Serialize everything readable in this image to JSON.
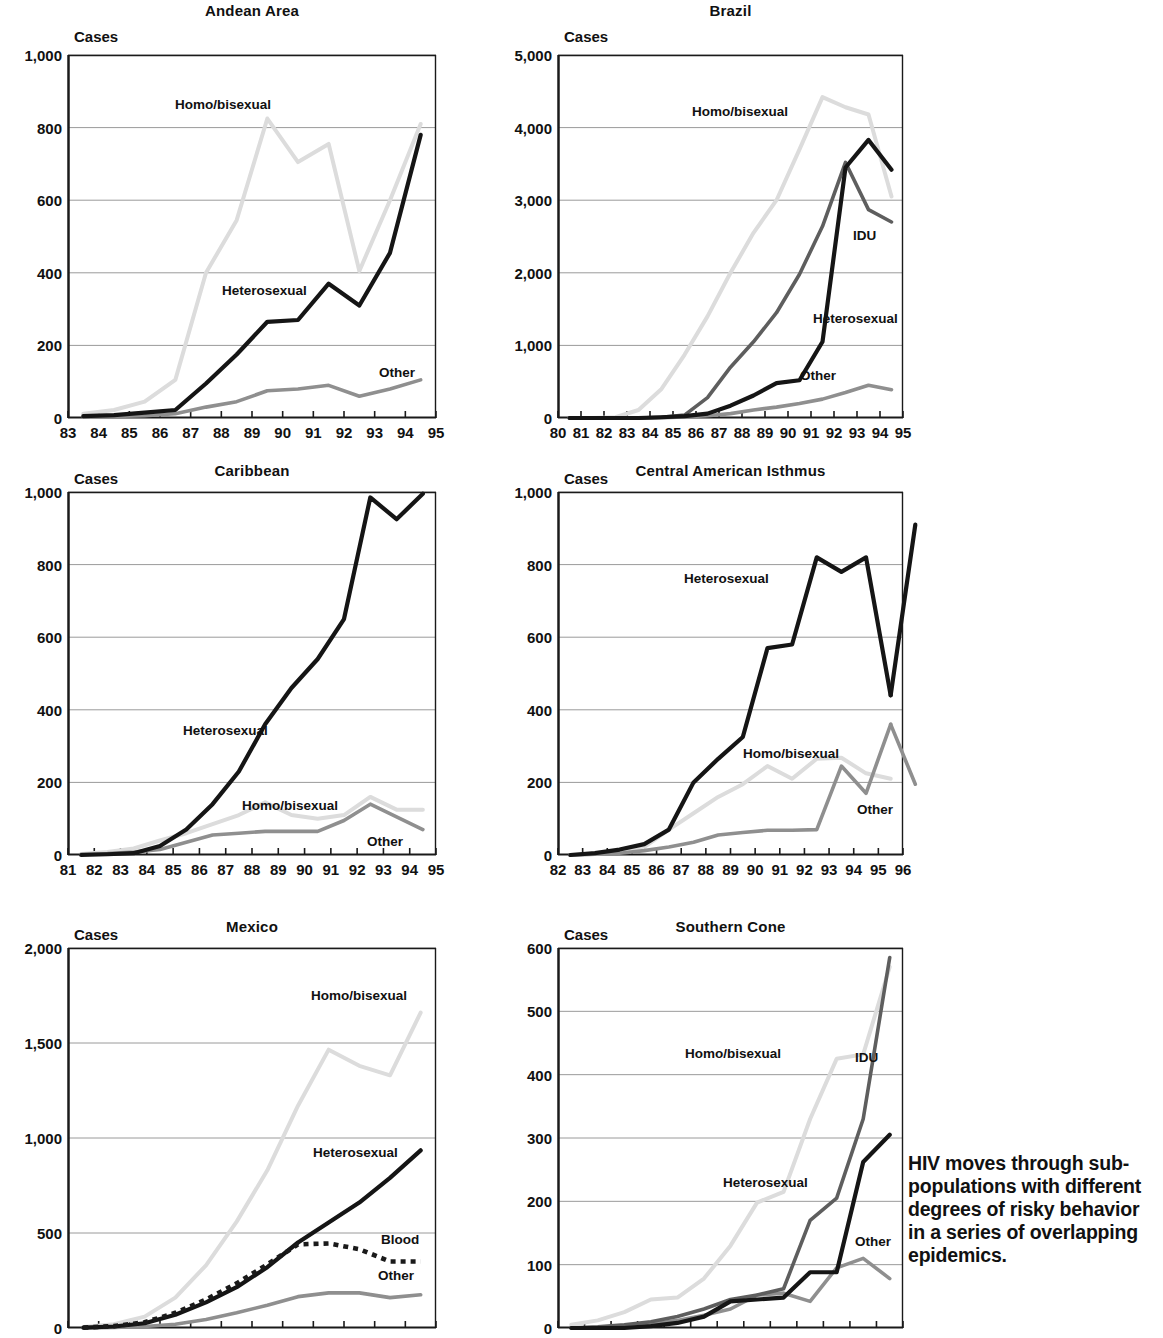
{
  "caption": {
    "lines": [
      "HIV moves through sub-",
      "populations with different",
      "degrees of risky behavior",
      "in a series of overlapping",
      "epidemics."
    ]
  },
  "colors": {
    "heterosexual": "#151515",
    "homo_bisexual": "#dcdcdc",
    "idu": "#5e5e5e",
    "other": "#8f8f8f",
    "blood": "#1a1a1a",
    "axis": "#1a1a1a",
    "grid": "#9a9a9a",
    "background": "#ffffff"
  },
  "axis_caption": "Cases",
  "chart_data": [
    {
      "type": "line",
      "title": "Andean Area",
      "xlabel": "",
      "ylabel": "Cases",
      "ylim": [
        0,
        1000
      ],
      "yticks": [
        0,
        200,
        400,
        600,
        800,
        1000
      ],
      "yticklabels": [
        "0",
        "200",
        "400",
        "600",
        "800",
        "1,000"
      ],
      "x": [
        83,
        84,
        85,
        86,
        87,
        88,
        89,
        90,
        91,
        92,
        93,
        94
      ],
      "xticklabels": [
        "83",
        "84",
        "85",
        "86",
        "87",
        "88",
        "89",
        "90",
        "91",
        "92",
        "93",
        "94",
        "95"
      ],
      "grid": true,
      "series": [
        {
          "name": "Homo/bisexual",
          "color_key": "homo_bisexual",
          "style": "solid",
          "values": [
            12,
            22,
            45,
            105,
            400,
            545,
            825,
            705,
            755,
            405,
            600,
            810
          ]
        },
        {
          "name": "Heterosexual",
          "color_key": "heterosexual",
          "style": "solid",
          "values": [
            5,
            8,
            15,
            22,
            95,
            175,
            265,
            270,
            370,
            310,
            455,
            780
          ]
        },
        {
          "name": "Other",
          "color_key": "other",
          "style": "solid",
          "values": [
            2,
            4,
            6,
            12,
            30,
            45,
            75,
            80,
            90,
            60,
            80,
            105
          ]
        }
      ]
    },
    {
      "type": "line",
      "title": "Brazil",
      "xlabel": "",
      "ylabel": "Cases",
      "ylim": [
        0,
        5000
      ],
      "yticks": [
        0,
        1000,
        2000,
        3000,
        4000,
        5000
      ],
      "yticklabels": [
        "0",
        "1,000",
        "2,000",
        "3,000",
        "4,000",
        "5,000"
      ],
      "x": [
        80,
        81,
        82,
        83,
        84,
        85,
        86,
        87,
        88,
        89,
        90,
        91,
        92,
        93,
        94
      ],
      "xticklabels": [
        "80",
        "81",
        "82",
        "83",
        "84",
        "85",
        "86",
        "87",
        "88",
        "89",
        "90",
        "91",
        "92",
        "93",
        "94",
        "95"
      ],
      "grid": true,
      "series": [
        {
          "name": "Homo/bisexual",
          "color_key": "homo_bisexual",
          "style": "solid",
          "values": [
            0,
            0,
            10,
            110,
            400,
            870,
            1400,
            2000,
            2550,
            3000,
            3700,
            4420,
            4280,
            4180,
            3050
          ]
        },
        {
          "name": "IDU",
          "color_key": "idu",
          "style": "solid",
          "values": [
            0,
            0,
            0,
            0,
            10,
            40,
            280,
            700,
            1050,
            1450,
            1980,
            2640,
            3520,
            2870,
            2700
          ]
        },
        {
          "name": "Heterosexual",
          "color_key": "heterosexual",
          "style": "solid",
          "values": [
            0,
            0,
            0,
            0,
            10,
            25,
            60,
            170,
            310,
            480,
            520,
            1050,
            3450,
            3830,
            3420
          ]
        },
        {
          "name": "Other",
          "color_key": "other",
          "style": "solid",
          "values": [
            0,
            0,
            0,
            0,
            5,
            15,
            30,
            60,
            110,
            150,
            200,
            260,
            350,
            450,
            390
          ]
        }
      ]
    },
    {
      "type": "line",
      "title": "Caribbean",
      "xlabel": "",
      "ylabel": "Cases",
      "ylim": [
        0,
        1000
      ],
      "yticks": [
        0,
        200,
        400,
        600,
        800,
        1000
      ],
      "yticklabels": [
        "0",
        "200",
        "400",
        "600",
        "800",
        "1,000"
      ],
      "x": [
        81,
        82,
        83,
        84,
        85,
        86,
        87,
        88,
        89,
        90,
        91,
        92,
        93,
        94
      ],
      "xticklabels": [
        "81",
        "82",
        "83",
        "84",
        "85",
        "86",
        "87",
        "88",
        "89",
        "90",
        "91",
        "92",
        "93",
        "94",
        "95"
      ],
      "grid": true,
      "series": [
        {
          "name": "Heterosexual",
          "color_key": "heterosexual",
          "style": "solid",
          "values": [
            0,
            2,
            5,
            25,
            70,
            140,
            230,
            360,
            460,
            540,
            650,
            985,
            925,
            995
          ]
        },
        {
          "name": "Homo/bisexual",
          "color_key": "homo_bisexual",
          "style": "solid",
          "values": [
            3,
            8,
            18,
            40,
            60,
            85,
            110,
            145,
            110,
            100,
            110,
            160,
            125,
            125
          ]
        },
        {
          "name": "Other",
          "color_key": "other",
          "style": "solid",
          "values": [
            2,
            4,
            8,
            15,
            35,
            55,
            60,
            65,
            65,
            65,
            95,
            140,
            105,
            70
          ]
        }
      ]
    },
    {
      "type": "line",
      "title": "Central American Isthmus",
      "xlabel": "",
      "ylabel": "Cases",
      "ylim": [
        0,
        1000
      ],
      "yticks": [
        0,
        200,
        400,
        600,
        800,
        1000
      ],
      "yticklabels": [
        "0",
        "200",
        "400",
        "600",
        "800",
        "1,000"
      ],
      "x": [
        82,
        83,
        84,
        85,
        86,
        87,
        88,
        89,
        90,
        91,
        92,
        93,
        94,
        95
      ],
      "xticklabels": [
        "82",
        "83",
        "84",
        "85",
        "86",
        "87",
        "88",
        "89",
        "90",
        "91",
        "92",
        "93",
        "94",
        "95",
        "96"
      ],
      "grid": true,
      "series": [
        {
          "name": "Heterosexual",
          "color_key": "heterosexual",
          "style": "solid",
          "values": [
            0,
            5,
            15,
            30,
            70,
            200,
            265,
            325,
            570,
            580,
            820,
            780,
            820,
            440
          ]
        },
        {
          "name": "Homo/bisexual",
          "color_key": "homo_bisexual",
          "style": "solid",
          "values": [
            0,
            3,
            10,
            22,
            70,
            115,
            160,
            195,
            245,
            210,
            265,
            268,
            225,
            210
          ]
        },
        {
          "name": "Other",
          "color_key": "other",
          "style": "solid",
          "values": [
            0,
            2,
            5,
            12,
            22,
            35,
            55,
            62,
            68,
            68,
            70,
            245,
            170,
            360
          ]
        }
      ],
      "extra_points": {
        "heterosexual_final": 910,
        "other_final": 195
      }
    },
    {
      "type": "line",
      "title": "Mexico",
      "xlabel": "",
      "ylabel": "Cases",
      "ylim": [
        0,
        2000
      ],
      "yticks": [
        0,
        500,
        1000,
        1500,
        2000
      ],
      "yticklabels": [
        "0",
        "500",
        "1,000",
        "1,500",
        "2,000"
      ],
      "x": [
        83,
        84,
        85,
        86,
        87,
        88,
        89,
        90,
        91,
        92,
        93,
        94
      ],
      "xticklabels": [],
      "grid": true,
      "clipped_bottom": true,
      "series": [
        {
          "name": "Homo/bisexual",
          "color_key": "homo_bisexual",
          "style": "solid",
          "values": [
            5,
            20,
            60,
            160,
            330,
            560,
            830,
            1170,
            1465,
            1380,
            1330,
            1660
          ]
        },
        {
          "name": "Heterosexual",
          "color_key": "heterosexual",
          "style": "solid",
          "values": [
            2,
            8,
            25,
            70,
            135,
            215,
            320,
            450,
            555,
            660,
            790,
            935
          ]
        },
        {
          "name": "Blood",
          "color_key": "blood",
          "style": "dotted",
          "values": [
            2,
            10,
            30,
            80,
            150,
            235,
            335,
            440,
            445,
            415,
            350,
            350
          ]
        },
        {
          "name": "Other",
          "color_key": "other",
          "style": "solid",
          "values": [
            0,
            3,
            8,
            20,
            45,
            80,
            120,
            165,
            185,
            185,
            160,
            175
          ]
        }
      ]
    },
    {
      "type": "line",
      "title": "Southern Cone",
      "xlabel": "",
      "ylabel": "Cases",
      "ylim": [
        0,
        600
      ],
      "yticks": [
        0,
        100,
        200,
        300,
        400,
        500,
        600
      ],
      "yticklabels": [
        "0",
        "100",
        "200",
        "300",
        "400",
        "500",
        "600"
      ],
      "x": [
        82,
        83,
        84,
        85,
        86,
        87,
        88,
        89,
        90,
        91,
        92,
        93,
        94
      ],
      "xticklabels": [],
      "grid": true,
      "clipped_bottom": true,
      "series": [
        {
          "name": "Homo/bisexual",
          "color_key": "homo_bisexual",
          "style": "solid",
          "values": [
            5,
            12,
            25,
            45,
            48,
            78,
            130,
            198,
            215,
            330,
            425,
            432,
            570
          ]
        },
        {
          "name": "IDU",
          "color_key": "idu",
          "style": "solid",
          "values": [
            0,
            2,
            5,
            10,
            18,
            30,
            45,
            52,
            62,
            170,
            205,
            330,
            585
          ]
        },
        {
          "name": "Heterosexual",
          "color_key": "heterosexual",
          "style": "solid",
          "values": [
            0,
            0,
            0,
            3,
            8,
            18,
            42,
            45,
            48,
            88,
            88,
            262,
            305
          ]
        },
        {
          "name": "Other",
          "color_key": "other",
          "style": "solid",
          "values": [
            0,
            1,
            3,
            6,
            12,
            20,
            30,
            52,
            55,
            42,
            95,
            110,
            78
          ]
        }
      ]
    }
  ],
  "annotations": [
    {
      "panel": 0,
      "text": "Homo/bisexual",
      "x": 175,
      "y": 97
    },
    {
      "panel": 0,
      "text": "Heterosexual",
      "x": 222,
      "y": 283
    },
    {
      "panel": 0,
      "text": "Other",
      "x": 379,
      "y": 365
    },
    {
      "panel": 1,
      "text": "Homo/bisexual",
      "x": 692,
      "y": 104
    },
    {
      "panel": 1,
      "text": "IDU",
      "x": 853,
      "y": 228
    },
    {
      "panel": 1,
      "text": "Heterosexual",
      "x": 813,
      "y": 311
    },
    {
      "panel": 1,
      "text": "Other",
      "x": 800,
      "y": 368
    },
    {
      "panel": 2,
      "text": "Heterosexual",
      "x": 183,
      "y": 723
    },
    {
      "panel": 2,
      "text": "Homo/bisexual",
      "x": 242,
      "y": 798
    },
    {
      "panel": 2,
      "text": "Other",
      "x": 367,
      "y": 834
    },
    {
      "panel": 3,
      "text": "Heterosexual",
      "x": 684,
      "y": 571
    },
    {
      "panel": 3,
      "text": "Homo/bisexual",
      "x": 743,
      "y": 746
    },
    {
      "panel": 3,
      "text": "Other",
      "x": 857,
      "y": 802
    },
    {
      "panel": 4,
      "text": "Homo/bisexual",
      "x": 311,
      "y": 988
    },
    {
      "panel": 4,
      "text": "Heterosexual",
      "x": 313,
      "y": 1145
    },
    {
      "panel": 4,
      "text": "Blood",
      "x": 381,
      "y": 1232
    },
    {
      "panel": 4,
      "text": "Other",
      "x": 378,
      "y": 1268
    },
    {
      "panel": 5,
      "text": "Homo/bisexual",
      "x": 685,
      "y": 1046
    },
    {
      "panel": 5,
      "text": "IDU",
      "x": 855,
      "y": 1050
    },
    {
      "panel": 5,
      "text": "Heterosexual",
      "x": 723,
      "y": 1175
    },
    {
      "panel": 5,
      "text": "Other",
      "x": 855,
      "y": 1234
    }
  ],
  "panel_geometry": [
    {
      "plot_x": 68,
      "plot_y": 55,
      "plot_w": 368,
      "plot_h": 363,
      "title_x": 68,
      "title_y": 2,
      "cases_x": 74,
      "cases_y": 28
    },
    {
      "plot_x": 558,
      "plot_y": 55,
      "plot_w": 345,
      "plot_h": 363,
      "title_x": 558,
      "title_y": 2,
      "cases_x": 564,
      "cases_y": 28
    },
    {
      "plot_x": 68,
      "plot_y": 492,
      "plot_w": 368,
      "plot_h": 363,
      "title_x": 68,
      "title_y": 462,
      "cases_x": 74,
      "cases_y": 470
    },
    {
      "plot_x": 558,
      "plot_y": 492,
      "plot_w": 345,
      "plot_h": 363,
      "title_x": 558,
      "title_y": 462,
      "cases_x": 564,
      "cases_y": 470
    },
    {
      "plot_x": 68,
      "plot_y": 948,
      "plot_w": 368,
      "plot_h": 380,
      "title_x": 68,
      "title_y": 918,
      "cases_x": 74,
      "cases_y": 926
    },
    {
      "plot_x": 558,
      "plot_y": 948,
      "plot_w": 345,
      "plot_h": 380,
      "title_x": 558,
      "title_y": 918,
      "cases_x": 564,
      "cases_y": 926
    }
  ]
}
